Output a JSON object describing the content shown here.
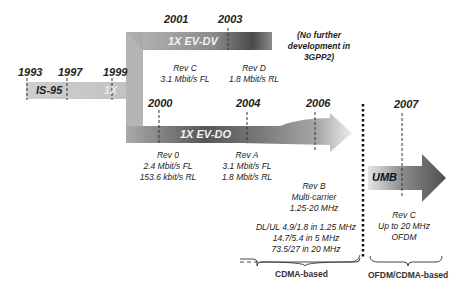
{
  "diagram": {
    "colors": {
      "bar_light": "#c8c8c8",
      "bar_dark": "#555555",
      "text": "#222222",
      "white_label": "#f2f2f2"
    },
    "years": {
      "y1993": "1993",
      "y1997": "1997",
      "y1999": "1999",
      "y2000": "2000",
      "y2001": "2001",
      "y2003": "2003",
      "y2004": "2004",
      "y2006": "2006",
      "y2007": "2007"
    },
    "bars": {
      "is95": "IS-95",
      "onex": "1X",
      "evdv": "1X EV-DV",
      "evdo": "1X EV-DO",
      "umb": "UMB"
    },
    "notes": {
      "no_further": [
        "(No further",
        "development in",
        "3GPP2)"
      ],
      "rev_c_dv": [
        "Rev C",
        "3.1 Mbit/s FL"
      ],
      "rev_d_dv": [
        "Rev D",
        "1.8 Mbit/s RL"
      ],
      "rev_0": [
        "Rev 0",
        "2.4 Mbit/s FL",
        "153.6 kbit/s RL"
      ],
      "rev_a": [
        "Rev A",
        "3.1 Mbit/s FL",
        "1.8 Mbit/s RL"
      ],
      "rev_b": [
        "Rev B",
        "Multi-carrier",
        "1.25-20 MHz"
      ],
      "rev_b_rates": [
        "DL/UL 4.9/1.8 in 1.25 MHz",
        "14.7/5.4 in 5 MHz",
        "73.5/27 in 20 MHz"
      ],
      "rev_c_umb": [
        "Rev C",
        "Up to 20 MHz",
        "OFDM"
      ]
    },
    "groups": {
      "cdma": "CDMA-based",
      "ofdm": "OFDM/CDMA-based"
    }
  }
}
